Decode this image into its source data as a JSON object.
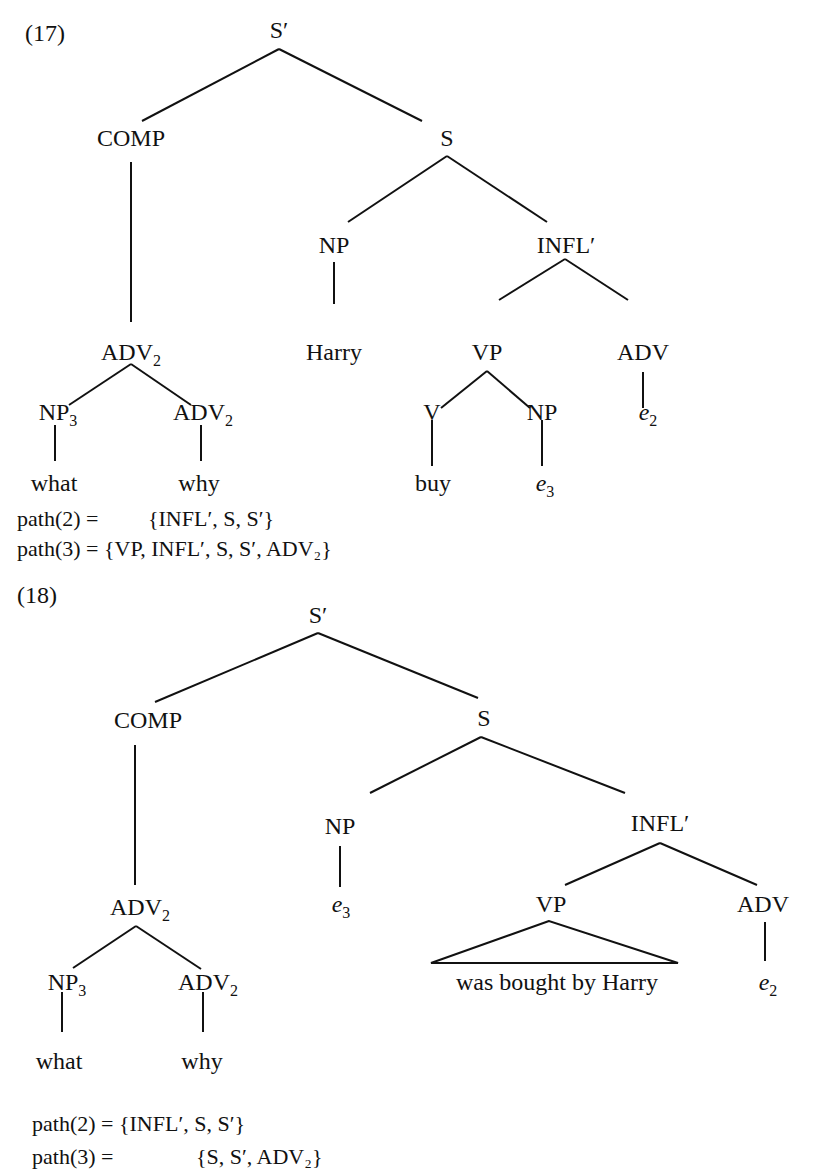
{
  "examples": [
    {
      "number": "(17)",
      "number_pos": [
        25,
        41
      ],
      "nodes": [
        {
          "id": "sbar",
          "label": "S",
          "prime": true,
          "x": 279,
          "y": 38
        },
        {
          "id": "comp",
          "label": "COMP",
          "x": 131,
          "y": 146
        },
        {
          "id": "s",
          "label": "S",
          "x": 447,
          "y": 146
        },
        {
          "id": "np_subj",
          "label": "NP",
          "x": 334,
          "y": 253
        },
        {
          "id": "inflbar",
          "label": "INFL",
          "prime": true,
          "x": 566,
          "y": 253
        },
        {
          "id": "adv2_top",
          "label": "ADV",
          "sub": "2",
          "x": 131,
          "y": 360
        },
        {
          "id": "harry",
          "label": "Harry",
          "x": 331,
          "y": 360
        },
        {
          "id": "vp",
          "label": "VP",
          "x": 487,
          "y": 360
        },
        {
          "id": "adv",
          "label": "ADV",
          "x": 643,
          "y": 360
        },
        {
          "id": "np3",
          "label": "NP",
          "sub": "3",
          "x": 55,
          "y": 468
        },
        {
          "id": "adv2_low",
          "label": "ADV",
          "sub": "2",
          "x": 201,
          "y": 468
        },
        {
          "id": "v",
          "label": "V",
          "x": 432,
          "y": 468
        },
        {
          "id": "np_obj",
          "label": "NP",
          "x": 542,
          "y": 468
        },
        {
          "id": "e2",
          "label": "e",
          "sub": "2",
          "italic": true,
          "x": 649,
          "y": 468
        },
        {
          "id": "what",
          "label": "what",
          "x": 54,
          "y": 491
        },
        {
          "id": "why",
          "label": "why",
          "x": 199,
          "y": 491
        },
        {
          "id": "buy",
          "label": "buy",
          "x": 433,
          "y": 491
        },
        {
          "id": "e3",
          "label": "e",
          "sub": "3",
          "italic": true,
          "x": 545,
          "y": 491
        }
      ],
      "edges": [
        [
          279,
          49,
          142,
          121
        ],
        [
          279,
          49,
          422,
          121
        ],
        [
          131,
          162,
          131,
          322
        ],
        [
          447,
          156,
          348,
          222
        ],
        [
          447,
          156,
          547,
          222
        ],
        [
          334,
          262,
          334,
          304
        ],
        [
          565,
          259,
          499,
          300
        ],
        [
          565,
          259,
          628,
          300
        ],
        [
          131,
          364,
          69,
          405
        ],
        [
          131,
          364,
          191,
          405
        ],
        [
          487,
          371,
          441,
          408
        ],
        [
          487,
          371,
          530,
          408
        ],
        [
          643,
          372,
          643,
          408
        ],
        [
          55,
          425,
          55,
          461
        ],
        [
          201,
          425,
          201,
          461
        ],
        [
          432,
          420,
          432,
          466
        ],
        [
          542,
          420,
          542,
          466
        ]
      ],
      "paths": [
        {
          "text": "path(2) =         {INFL′, S, S′}",
          "x": 17,
          "y": 623
        },
        {
          "text": "path(3) = {VP, INFL′, S, S′, ADV₂}",
          "x": 17,
          "y": 655
        }
      ]
    },
    {
      "number": "(18)",
      "number_pos": [
        17,
        699
      ],
      "nodes": [
        {
          "id": "sbar",
          "label": "S",
          "prime": true,
          "x": 318,
          "y": 688
        },
        {
          "id": "comp",
          "label": "COMP",
          "x": 146,
          "y": 799
        },
        {
          "id": "s",
          "label": "S",
          "x": 480,
          "y": 799
        },
        {
          "id": "np_subj",
          "label": "NP",
          "x": 340,
          "y": 907
        },
        {
          "id": "inflbar",
          "label": "INFL",
          "prime": true,
          "x": 659,
          "y": 907
        },
        {
          "id": "adv2_top",
          "label": "ADV",
          "sub": "2",
          "x": 140,
          "y": 1013
        },
        {
          "id": "e3",
          "label": "e",
          "sub": "3",
          "italic": true,
          "x": 341,
          "y": 1013
        },
        {
          "id": "vp",
          "label": "VP",
          "x": 551,
          "y": 907
        },
        {
          "id": "adv",
          "label": "ADV",
          "x": 763,
          "y": 907
        },
        {
          "id": "vp_yield",
          "label": "was bought by Harry",
          "x": 557,
          "y": 990
        },
        {
          "id": "e2",
          "label": "e",
          "sub": "2",
          "italic": true,
          "x": 768,
          "y": 990
        },
        {
          "id": "np3",
          "label": "NP",
          "sub": "3",
          "x": 67,
          "y": 1055
        },
        {
          "id": "adv2_low",
          "label": "ADV",
          "sub": "2",
          "x": 208,
          "y": 1055
        },
        {
          "id": "what",
          "label": "what",
          "x": 59,
          "y": 1132
        },
        {
          "id": "why",
          "label": "why",
          "x": 202,
          "y": 1132
        }
      ],
      "edges": [
        [
          318,
          711,
          240,
          763
        ],
        [
          318,
          711,
          463,
          763
        ],
        [
          135,
          826,
          135,
          980
        ],
        [
          483,
          805,
          406,
          849
        ],
        [
          483,
          805,
          621,
          849
        ]
      ],
      "paths": [
        {
          "text": "path(2) = {INFL′, S, S′}",
          "x": 32,
          "y": 1125
        },
        {
          "text": "path(3) =               {S, S′, ADV₂}",
          "x": 32,
          "y": 1159
        }
      ]
    }
  ]
}
